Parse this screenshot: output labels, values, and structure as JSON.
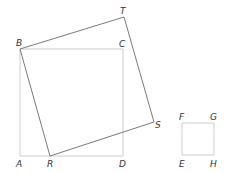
{
  "diagram": {
    "type": "geometry",
    "colors": {
      "background": "#ffffff",
      "tilted_square": "#7a7a7a",
      "light_squares": "#cccccc",
      "label": "#333333"
    },
    "points": {
      "A": {
        "label": "A",
        "x": 20,
        "y": 156
      },
      "B": {
        "label": "B",
        "x": 20,
        "y": 49
      },
      "C": {
        "label": "C",
        "x": 123,
        "y": 49
      },
      "D": {
        "label": "D",
        "x": 123,
        "y": 156
      },
      "R": {
        "label": "R",
        "x": 50,
        "y": 156
      },
      "S": {
        "label": "S",
        "x": 154,
        "y": 122
      },
      "T": {
        "label": "T",
        "x": 124,
        "y": 17
      },
      "E": {
        "label": "E",
        "x": 182,
        "y": 155
      },
      "F": {
        "label": "F",
        "x": 182,
        "y": 123
      },
      "G": {
        "label": "G",
        "x": 214,
        "y": 123
      },
      "H": {
        "label": "H",
        "x": 214,
        "y": 155
      }
    },
    "shapes": [
      {
        "name": "square-ABCD",
        "vertices": [
          "A",
          "B",
          "C",
          "D"
        ],
        "style": "light"
      },
      {
        "name": "square-BTSR",
        "vertices": [
          "B",
          "T",
          "S",
          "R"
        ],
        "style": "dark"
      },
      {
        "name": "square-EFGH",
        "vertices": [
          "E",
          "F",
          "G",
          "H"
        ],
        "style": "light"
      }
    ]
  }
}
